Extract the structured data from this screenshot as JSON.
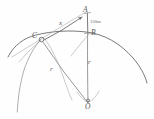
{
  "diagram": {
    "style": "hand-drawn pencil sketch",
    "ink_color": "#6a6a6a",
    "background_color": "#fefefe",
    "points": [
      {
        "id": "A",
        "label": "A",
        "x": 87,
        "y": 12,
        "role": "apex-point-above-circle"
      },
      {
        "id": "B",
        "label": "B",
        "x": 88,
        "y": 33,
        "role": "point-on-arc"
      },
      {
        "id": "C",
        "label": "C",
        "x": 41,
        "y": 39,
        "role": "point-on-arc"
      },
      {
        "id": "O",
        "label": "O",
        "x": 88,
        "y": 103,
        "role": "circle-center"
      }
    ],
    "segment_labels": [
      {
        "id": "x",
        "label": "x",
        "describes": "segment C to A",
        "x": 59,
        "y": 20
      },
      {
        "id": "r-left",
        "label": "r",
        "describes": "radius O to C",
        "x": 50,
        "y": 66
      },
      {
        "id": "r-right",
        "label": "r",
        "describes": "radius O to B",
        "x": 88,
        "y": 59
      },
      {
        "id": "dimension",
        "label": "150m",
        "describes": "segment A to B",
        "x": 90,
        "y": 19
      }
    ]
  }
}
